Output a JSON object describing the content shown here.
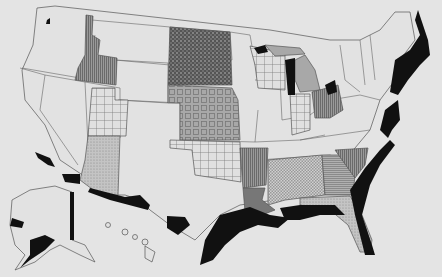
{
  "map": {
    "title": "",
    "background": "#e4e4e4",
    "state_fill": "#e2e2e2",
    "coast_color": "#111111",
    "patterned_regions": [
      {
        "name": "idaho",
        "pattern": "vertical-lines"
      },
      {
        "name": "north-dakota-south-dakota",
        "pattern": "speckle-dark"
      },
      {
        "name": "nebraska-kansas",
        "pattern": "squares"
      },
      {
        "name": "utah",
        "pattern": "grid"
      },
      {
        "name": "oklahoma",
        "pattern": "grid"
      },
      {
        "name": "arizona",
        "pattern": "speckle-light"
      },
      {
        "name": "wisconsin",
        "pattern": "grid"
      },
      {
        "name": "michigan",
        "pattern": "solid-gray"
      },
      {
        "name": "indiana",
        "pattern": "grid"
      },
      {
        "name": "ohio",
        "pattern": "vertical-lines"
      },
      {
        "name": "arkansas",
        "pattern": "vertical-lines"
      },
      {
        "name": "louisiana",
        "pattern": "solid-dark-gray"
      },
      {
        "name": "mississippi",
        "pattern": "checker"
      },
      {
        "name": "alabama",
        "pattern": "checker"
      },
      {
        "name": "georgia",
        "pattern": "horizontal-lines"
      },
      {
        "name": "south-carolina",
        "pattern": "vertical-lines"
      },
      {
        "name": "florida",
        "pattern": "speckle-light"
      }
    ]
  }
}
